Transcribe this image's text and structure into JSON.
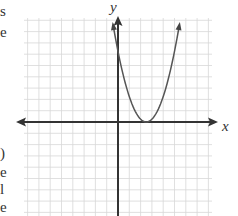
{
  "edge_fragments": [
    {
      "text": "s",
      "top": 4
    },
    {
      "text": "e",
      "top": 25
    },
    {
      "text": ")",
      "top": 146
    },
    {
      "text": "e",
      "top": 165
    },
    {
      "text": "l",
      "top": 182
    },
    {
      "text": "e",
      "top": 200
    }
  ],
  "chart_data": {
    "type": "line",
    "title": "",
    "xlabel": "x",
    "ylabel": "y",
    "grid": true,
    "xlim": [
      -8,
      9
    ],
    "ylim": [
      -8,
      10
    ],
    "axis_ticks_labeled": false,
    "series": [
      {
        "name": "parabola",
        "equation_estimate": "y = (x - 2.5)^2",
        "vertex": [
          2.5,
          0
        ],
        "points": [
          [
            0.6,
            10
          ],
          [
            0,
            6.25
          ],
          [
            1,
            2.25
          ],
          [
            2,
            0.25
          ],
          [
            2.5,
            0
          ],
          [
            3,
            0.25
          ],
          [
            4,
            2.25
          ],
          [
            5,
            6.25
          ],
          [
            5.6,
            10
          ]
        ]
      }
    ],
    "colors": {
      "grid": "#d8d8d8",
      "axes": "#333333",
      "curve": "#555555"
    }
  }
}
